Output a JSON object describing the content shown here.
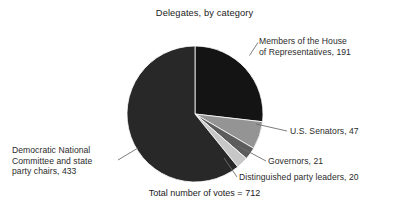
{
  "chart_data": {
    "type": "pie",
    "title": "Delegates, by category",
    "footer": "Total number of votes = 712",
    "total": 712,
    "total_label": "Total number of votes",
    "categories": [
      "Members of the House of Representatives",
      "U.S. Senators",
      "Governors",
      "Distinguished party leaders",
      "Democratic National Committee and state party chairs"
    ],
    "values": [
      191,
      47,
      21,
      20,
      433
    ],
    "legend_position": "callout-labels",
    "grid": false,
    "slices": [
      {
        "name": "house",
        "label": "Members of the House of Representatives, 191",
        "label_line_1": "Members of the House",
        "label_line_2": "of Representatives, 191",
        "value": 191,
        "color": "#141414",
        "start_angle": 0,
        "sweep_angle": 96.6
      },
      {
        "name": "senators",
        "label": "U.S. Senators, 47",
        "value": 47,
        "color": "#949494",
        "start_angle": 96.6,
        "sweep_angle": 23.8
      },
      {
        "name": "governors",
        "label": "Governors, 21",
        "value": 21,
        "color": "#5c5c5c",
        "start_angle": 120.4,
        "sweep_angle": 10.6
      },
      {
        "name": "distinguished-party-leaders",
        "label": "Distinguished party leaders, 20",
        "value": 20,
        "color": "#c7c7c7",
        "start_angle": 131.0,
        "sweep_angle": 10.1
      },
      {
        "name": "dnc",
        "label": "Democratic National Committee and state party chairs, 433",
        "label_line_1": "Democratic National",
        "label_line_2": "Committee and state",
        "label_line_3": "party chairs, 433",
        "value": 433,
        "color": "#282828",
        "start_angle": 141.1,
        "sweep_angle": 218.9
      }
    ],
    "geometry": {
      "center_x": 195,
      "center_y": 114,
      "radius": 68
    },
    "colors": {
      "background": "#ffffff",
      "text": "#2b2b2b",
      "leader_line": "#6e6e6e"
    }
  }
}
